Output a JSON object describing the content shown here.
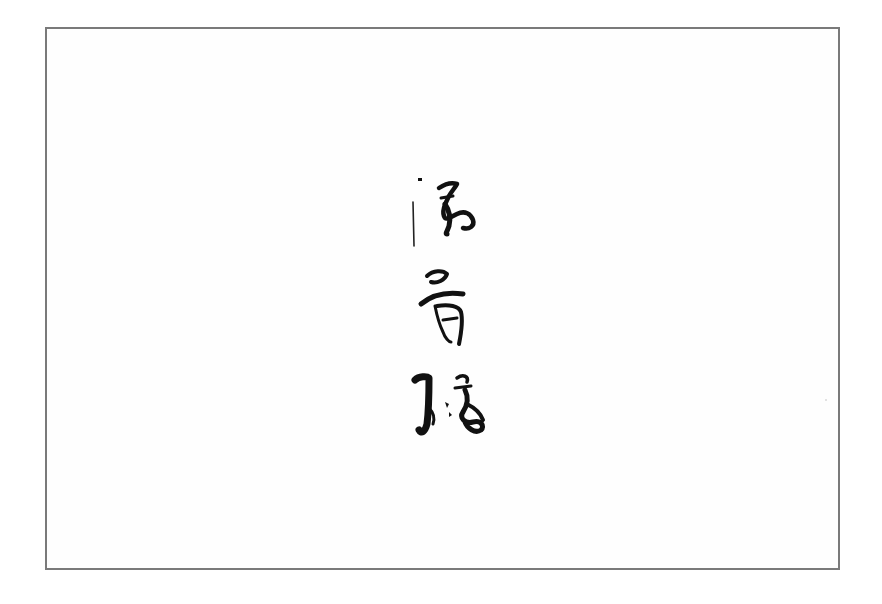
{
  "artwork": {
    "type": "calligraphy",
    "orientation": "vertical",
    "characters": [
      {
        "index": 0,
        "label": "char-1"
      },
      {
        "index": 1,
        "label": "char-2"
      },
      {
        "index": 2,
        "label": "char-3"
      }
    ],
    "ink_color": "#111111",
    "frame_color": "#7a7a7a",
    "background_color": "#ffffff"
  }
}
